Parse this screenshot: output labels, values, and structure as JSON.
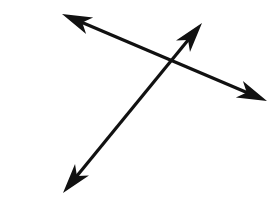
{
  "figure": {
    "title": "Two intersecting lines",
    "caption": "",
    "type": "geometry-diagram",
    "width": 274,
    "height": 215,
    "background_color": "#ffffff",
    "stroke_color": "#111111",
    "stroke_width": 3.2,
    "arrowhead_style": "barbed-swept-back",
    "arrowhead_length": 30,
    "arrowhead_half_width": 9,
    "arrowhead_notch": 8,
    "intersection": {
      "label": "",
      "x": 168,
      "y": 68
    },
    "lines": [
      {
        "id": "line-a",
        "name": "descending-line",
        "label": "",
        "double_headed": true,
        "start": {
          "x": 62,
          "y": 14
        },
        "end": {
          "x": 267,
          "y": 101
        },
        "start_arrow": true,
        "end_arrow": true
      },
      {
        "id": "line-b",
        "name": "ascending-line",
        "label": "",
        "double_headed": true,
        "start": {
          "x": 63,
          "y": 193
        },
        "end": {
          "x": 202,
          "y": 23
        },
        "start_arrow": true,
        "end_arrow": true
      }
    ]
  }
}
